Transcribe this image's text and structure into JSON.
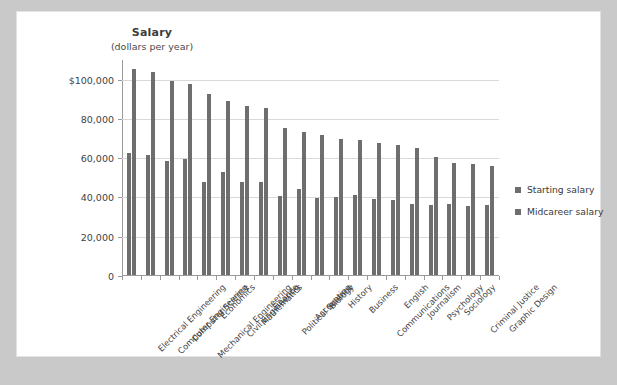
{
  "chart_data": {
    "type": "bar",
    "title": "Salary",
    "subtitle": "(dollars per year)",
    "xlabel": "",
    "ylabel": "Salary (dollars per year)",
    "ylim": [
      0,
      110000
    ],
    "grid": true,
    "legend_position": "right",
    "ytick_labels": [
      "0",
      "20,000",
      "40,000",
      "60,000",
      "80,000",
      "$100,000"
    ],
    "ytick_values": [
      0,
      20000,
      40000,
      60000,
      80000,
      100000
    ],
    "categories": [
      "Electrical Engineering",
      "Computer Engineering",
      "Computer Science",
      "Mechanical Engineering",
      "Economics",
      "Civil Engineering",
      "Mathematics",
      "Finance",
      "Political Science",
      "Accounting",
      "Biology",
      "History",
      "Business",
      "Communications",
      "English",
      "Journalism",
      "Psychology",
      "Sociology",
      "Criminal Justice",
      "Graphic Design"
    ],
    "series": [
      {
        "name": "Starting salary",
        "color": "#6e6e6e",
        "values": [
          62000,
          61000,
          58000,
          59000,
          47500,
          52500,
          47500,
          47500,
          40000,
          44000,
          39000,
          39500,
          41000,
          38500,
          38000,
          36000,
          35500,
          36000,
          35000,
          35500
        ]
      },
      {
        "name": "Midcareer salary",
        "color": "#6e6e6e",
        "values": [
          105000,
          103500,
          99000,
          97500,
          92000,
          88500,
          86000,
          85000,
          75000,
          73000,
          71500,
          69500,
          69000,
          67000,
          66000,
          64500,
          60000,
          57000,
          56500,
          55500
        ]
      }
    ]
  },
  "legend": {
    "items": [
      {
        "label": "Starting salary"
      },
      {
        "label": "Midcareer salary"
      }
    ]
  }
}
